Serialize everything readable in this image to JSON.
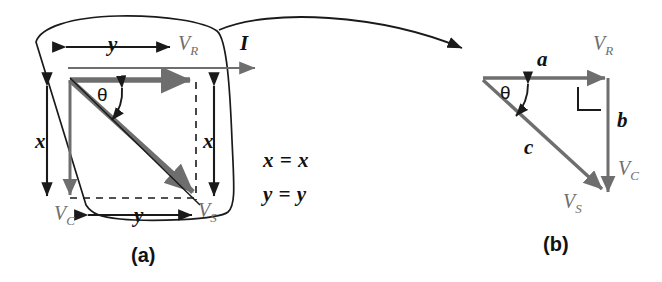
{
  "figure": {
    "panels": [
      {
        "id": "a",
        "caption": "(a)",
        "labels": {
          "vr": "V",
          "vr_sub": "R",
          "vc": "V",
          "vc_sub": "C",
          "vs": "V",
          "vs_sub": "S",
          "current": "I",
          "theta": "θ",
          "dim_y_top": "y",
          "dim_y_bottom": "y",
          "dim_x_left": "x",
          "dim_x_right": "x",
          "identity_x": "x = x",
          "identity_y": "y = y"
        }
      },
      {
        "id": "b",
        "caption": "(b)",
        "labels": {
          "side_a": "a",
          "side_b": "b",
          "side_c": "c",
          "vr": "V",
          "vr_sub": "R",
          "vc": "V",
          "vc_sub": "C",
          "vs": "V",
          "vs_sub": "S",
          "theta": "θ"
        }
      }
    ],
    "colors": {
      "vector_gray": "#6e6e6e",
      "outline_black": "#1a1a1a",
      "background": "#ffffff"
    }
  }
}
